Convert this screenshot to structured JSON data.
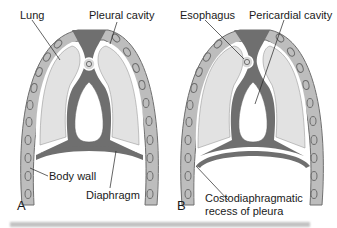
{
  "figure": {
    "panels": [
      {
        "letter": "A",
        "labels": {
          "lung": "Lung",
          "pleural_cavity": "Pleural cavity",
          "body_wall": "Body wall",
          "diaphragm": "Diaphragm"
        }
      },
      {
        "letter": "B",
        "labels": {
          "esophagus": "Esophagus",
          "pericardial_cavity": "Pericardial cavity",
          "costodiaphragmatic_line1": "Costodiaphragmatic",
          "costodiaphragmatic_line2": "recess of pleura"
        }
      }
    ],
    "colors": {
      "body_wall": "#bdbdbd",
      "wall_outline": "#6e6e6e",
      "lung": "#e2e2e2",
      "mediastinum": "#6f6f6f",
      "background": "#ffffff"
    },
    "caption": ""
  }
}
